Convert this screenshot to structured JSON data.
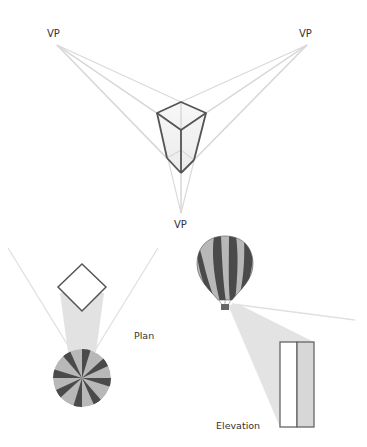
{
  "diagram": {
    "labels": {
      "vp_left": "VP",
      "vp_right": "VP",
      "vp_bottom": "VP",
      "plan": "Plan",
      "elevation": "Elevation"
    },
    "colors": {
      "background": "#ffffff",
      "construction_line": "#d6d6d6",
      "outline": "#555555",
      "beam": "#e2e2e2",
      "stripe_dark": "#4a4a4a",
      "stripe_light": "#b8b8b8",
      "label": "#333333"
    },
    "nodes": [
      {
        "id": "vp-left",
        "label": "VP",
        "x": 57,
        "y": 45
      },
      {
        "id": "vp-right",
        "label": "VP",
        "x": 307,
        "y": 45
      },
      {
        "id": "vp-bottom",
        "label": "VP",
        "x": 181,
        "y": 213
      },
      {
        "id": "box",
        "label": "",
        "type": "wireframe-prism"
      },
      {
        "id": "plan-square",
        "label": "",
        "type": "diamond"
      },
      {
        "id": "parachute",
        "label": "",
        "type": "striped-canopy-top-view"
      },
      {
        "id": "balloon",
        "label": "",
        "type": "hot-air-balloon"
      },
      {
        "id": "elevation-rect",
        "label": "",
        "type": "split-rectangle"
      }
    ],
    "edges": [
      {
        "from": "vp-left",
        "to": "box",
        "kind": "construction-lines"
      },
      {
        "from": "vp-right",
        "to": "box",
        "kind": "construction-lines"
      },
      {
        "from": "vp-bottom",
        "to": "box",
        "kind": "construction-lines"
      },
      {
        "from": "plan-square",
        "to": "parachute",
        "kind": "view-beam"
      },
      {
        "from": "balloon",
        "to": "elevation-rect",
        "kind": "view-beam"
      }
    ]
  }
}
